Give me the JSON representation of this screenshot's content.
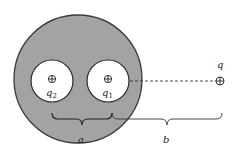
{
  "diagram": {
    "colors": {
      "conductor_fill": "#a3a3a3",
      "conductor_stroke": "#3a3a3a",
      "cavity_fill": "#ffffff",
      "line_color": "#333333",
      "background": "#ffffff"
    },
    "conductor": {
      "cx": 78,
      "cy": 79,
      "r": 64
    },
    "cavities": [
      {
        "id": "cavity-2",
        "cx": 52,
        "cy": 81,
        "r": 21,
        "charge_symbol": "⊕",
        "label_main": "q",
        "label_sub": "2"
      },
      {
        "id": "cavity-1",
        "cx": 108,
        "cy": 81,
        "r": 21,
        "charge_symbol": "⊕",
        "label_main": "q",
        "label_sub": "1"
      }
    ],
    "external_charge": {
      "cx": 220,
      "cy": 81,
      "symbol": "⊕",
      "label": "q"
    },
    "dashed_line": {
      "x1": 130,
      "y1": 81,
      "x2": 215,
      "y2": 81
    },
    "braces": [
      {
        "id": "brace-a",
        "x1": 52,
        "x2": 112,
        "y": 113,
        "label": "a"
      },
      {
        "id": "brace-b",
        "x1": 112,
        "x2": 222,
        "y": 113,
        "label": "b"
      }
    ]
  }
}
